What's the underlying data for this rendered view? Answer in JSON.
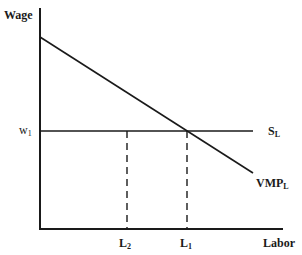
{
  "diagram": {
    "title": "",
    "type": "labor-market-equilibrium",
    "y_axis_label": "Wage",
    "x_axis_label": "Labor",
    "wage_level": {
      "base": "w",
      "sub": "1"
    },
    "supply_curve": {
      "base": "S",
      "sub": "L",
      "description": "horizontal supply of labor at w1"
    },
    "demand_curve": {
      "base": "VMP",
      "sub": "L",
      "description": "downward-sloping value of marginal product of labor"
    },
    "quantities": [
      {
        "base": "L",
        "sub": "2",
        "description": "dashed vertical marker left of equilibrium"
      },
      {
        "base": "L",
        "sub": "1",
        "description": "equilibrium labor where VMP_L meets S_L"
      }
    ],
    "colors": {
      "line": "#1a1a1a",
      "background": "#ffffff"
    }
  }
}
